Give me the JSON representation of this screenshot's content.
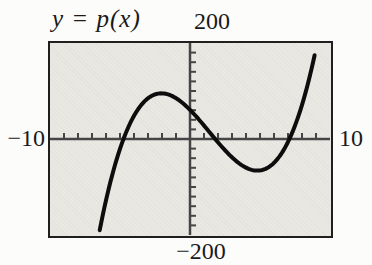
{
  "figure": {
    "title": "y = p(x)",
    "labels": {
      "y_max": "200",
      "y_min": "−200",
      "x_min": "−10",
      "x_max": "10"
    }
  },
  "chart_data": {
    "type": "line",
    "title": "y = p(x)",
    "xlabel": "",
    "ylabel": "",
    "x_range": [
      -10,
      10
    ],
    "y_range": [
      -200,
      200
    ],
    "x_tick_step": 1,
    "y_tick_step": 20,
    "grid": false,
    "legend": "none",
    "axis_labels": {
      "x_min": "−10",
      "x_max": "10",
      "y_max": "200",
      "y_min": "−200"
    },
    "series": [
      {
        "name": "p(x)",
        "model": "cubic_polynomial",
        "roots": [
          -4.75,
          1.8,
          7.1
        ],
        "leading_coefficient": 1,
        "domain": [
          -6.45,
          8.9
        ],
        "key_points": {
          "x_intercepts": [
            -4.75,
            1.8,
            7.1
          ],
          "y_intercept": 61,
          "local_max": {
            "x": -2.1,
            "y": 95
          },
          "local_min": {
            "x": 4.9,
            "y": -65
          },
          "start": {
            "x": -6.45,
            "y": -190
          },
          "end": {
            "x": 8.9,
            "y": 175
          }
        }
      }
    ],
    "colors": {
      "curve": "#0d0d0d",
      "axis": "#454545",
      "plot_bg": "#e9e8e3",
      "border": "#1f1f1f",
      "text": "#1a1a1a"
    },
    "style": {
      "curve_width": 4,
      "axis_width": 2.5,
      "tick_len": 6
    }
  }
}
